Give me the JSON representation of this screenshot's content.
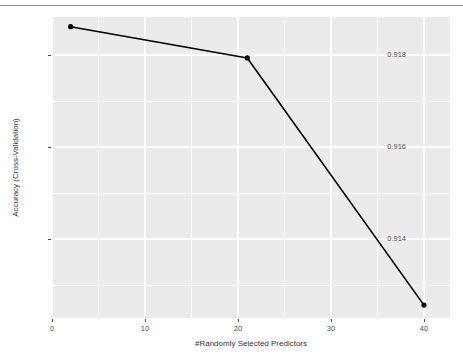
{
  "chart_data": {
    "type": "line",
    "title": "",
    "subtitle": "",
    "xlabel": "#Randomly Selected Predictors",
    "ylabel": "Accuracy (Cross-Validation)",
    "x": [
      2,
      21,
      40
    ],
    "values": [
      0.91861,
      0.91793,
      0.91256
    ],
    "series": [
      {
        "name": "Accuracy (Cross-Validation)",
        "x": [
          2,
          21,
          40
        ],
        "values": [
          0.91861,
          0.91793,
          0.91256
        ]
      }
    ],
    "xlim": [
      0.0,
      42.8
    ],
    "ylim": [
      0.91228,
      0.91882
    ],
    "xticks": [
      0,
      10,
      20,
      30,
      40
    ],
    "xtick_labels": [
      "0",
      "10",
      "20",
      "30",
      "40"
    ],
    "yticks": [
      0.914,
      0.916,
      0.918
    ],
    "ytick_labels": [
      "0.914",
      "0.916",
      "0.918"
    ],
    "grid": true,
    "legend": "none",
    "marker": "point",
    "line_color": "#000000",
    "point_color": "#000000",
    "panel_color": "#ebebeb",
    "grid_color": "#ffffff",
    "axis_text_color": "#4d4d4d",
    "axis_title_color": "#333333"
  },
  "figure": {
    "top_rule_color": "#8a8d93",
    "background": "#ffffff"
  }
}
